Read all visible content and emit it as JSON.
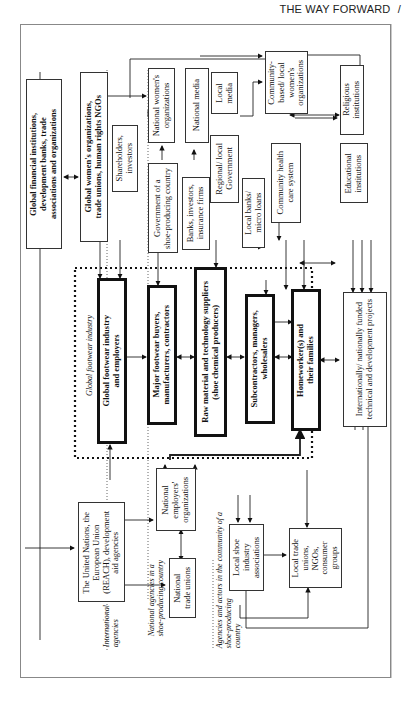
{
  "header": {
    "title": "THE WAY FORWARD",
    "separator": "/"
  },
  "diagram": {
    "global_industry_label": "Global footwear industry",
    "zone_labels": {
      "international": "International\nagencies",
      "national": "National agencies in a\nshoe-producing country",
      "community": "Agencies and actors in the community of a\nshoe-producing\ncountry"
    },
    "boxes": {
      "global_financial": "Global financial institutions,\ndevelopment banks, trade\nassociations and organizations",
      "global_womens": "Global women's organizations,\ntrade unions, human rights NGOs",
      "shareholders": "Shareholders,\ninvestors",
      "national_womens": "National women's\norganizations",
      "national_media": "National media",
      "government": "Government of a\nshoe-producing country",
      "banks": "Banks, investors,\ninsurance firms",
      "local_media": "Local\nmedia",
      "regional_gov": "Regional/ local\nGovernment",
      "local_banks": "Local banks/\nmicro loans",
      "community_womens": "Community-\nbased/ local\nwomen's\norganizations",
      "community_health": "Community health\ncare system",
      "religious": "Religious\ninstitutions",
      "educational": "Educational\ninstitutions",
      "global_footwear": "Global footwear industry\nand employers",
      "major_buyers": "Major footwear buyers,\nmanufacturers, contractors",
      "raw_material": "Raw material and technology suppliers\n(shoe chemical producers)",
      "subcontractors": "Subcontractors, managers,\nwholesalers",
      "homeworkers": "Homeworker(s) and\ntheir families",
      "intl_projects": "Internationally/ nationally funded\ntechnical and development projects",
      "un_eu": "The United Nations, the\nEuropean Union\n(REACH), development\naid agencies",
      "national_employers": "National\nemployers'\norganizations",
      "national_unions": "National\ntrade unions",
      "local_shoe": "Local shoe\nindustry\nassociations",
      "local_trade": "Local trade\nunions,\nNGOs,\nconsumer\ngroups"
    }
  }
}
